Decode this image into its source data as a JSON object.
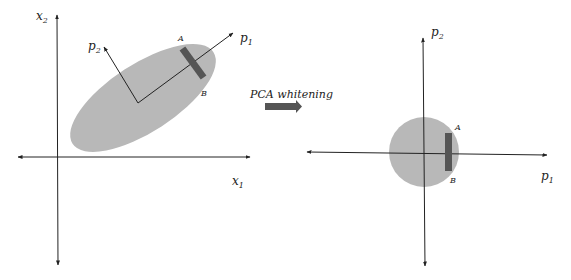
{
  "diagram": {
    "title": "PCA whitening",
    "colors": {
      "background": "#ffffff",
      "axis": "#222222",
      "ellipse_fill": "#b8b8b8",
      "band_fill": "#555555",
      "arrow_fill": "#555555"
    },
    "left_panel": {
      "x_axis_label": "x",
      "x_axis_sub": "1",
      "y_axis_label": "x",
      "y_axis_sub": "2",
      "pc1_label": "p",
      "pc1_sub": "1",
      "pc2_label": "p",
      "pc2_sub": "2",
      "point_a": "A",
      "point_b": "B"
    },
    "transform": {
      "label": "PCA whitening"
    },
    "right_panel": {
      "x_axis_label": "p",
      "x_axis_sub": "1",
      "y_axis_label": "p",
      "y_axis_sub": "2",
      "point_a": "A",
      "point_b": "B"
    }
  }
}
